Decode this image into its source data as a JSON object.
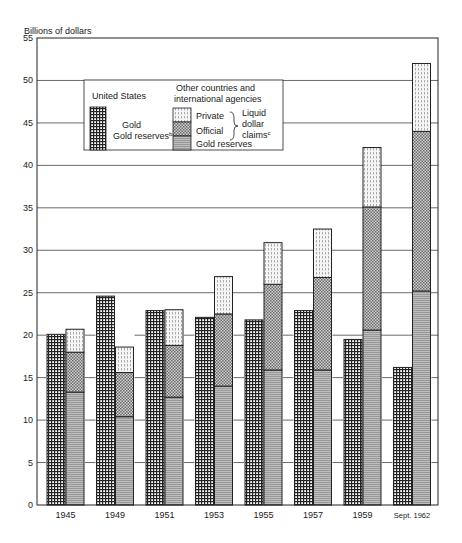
{
  "chart_data": {
    "type": "bar",
    "title": "",
    "ylabel": "Billions of dollars",
    "xlabel": "",
    "ylim": [
      0,
      55
    ],
    "yticks": [
      0,
      5,
      10,
      15,
      20,
      25,
      30,
      35,
      40,
      45,
      50,
      55
    ],
    "grid": true,
    "categories": [
      "1945",
      "1949",
      "1951",
      "1953",
      "1955",
      "1957",
      "1959",
      "Sept. 1962"
    ],
    "series": [
      {
        "name": "United States — Gold reserves",
        "group": "United States",
        "values": [
          20.1,
          24.6,
          22.9,
          22.1,
          21.8,
          22.9,
          19.5,
          16.2
        ]
      },
      {
        "name": "Other countries — Gold reserves",
        "group": "Other countries",
        "stack": "other",
        "values": [
          13.3,
          10.4,
          12.7,
          14.0,
          15.9,
          15.9,
          20.6,
          25.2
        ]
      },
      {
        "name": "Other countries — Official liquid dollar claims",
        "group": "Other countries",
        "stack": "other",
        "values": [
          4.7,
          5.2,
          6.1,
          8.5,
          10.1,
          10.9,
          14.5,
          18.8
        ]
      },
      {
        "name": "Other countries — Private liquid dollar claims",
        "group": "Other countries",
        "stack": "other",
        "values": [
          2.7,
          3.0,
          4.2,
          4.4,
          4.9,
          5.7,
          7.0,
          8.0
        ]
      }
    ],
    "legend": {
      "position": "upper-left-inset",
      "us_heading": "United States",
      "us_item": "Gold reserves",
      "us_item_sup": "b",
      "other_heading_1": "Other countries and",
      "other_heading_2": "international agencies",
      "private": "Private",
      "official": "Official",
      "gold": "Gold reserves",
      "brace_1": "Liquid",
      "brace_2": "dollar",
      "brace_3": "claims",
      "brace_sup": "c"
    }
  }
}
